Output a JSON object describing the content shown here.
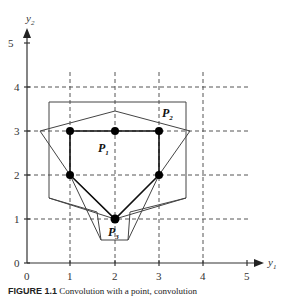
{
  "figure": {
    "caption_label": "FIGURE 1.1",
    "caption_text": "Convolution with a point, convolution",
    "x_axis_label": "y",
    "x_axis_sub": "1",
    "y_axis_label": "y",
    "y_axis_sub": "2",
    "x_ticks": [
      "0",
      "1",
      "2",
      "3",
      "4",
      "5"
    ],
    "y_ticks": [
      "0",
      "1",
      "2",
      "3",
      "4",
      "5"
    ],
    "points": [
      {
        "label": "P",
        "sub": "1",
        "x": 2,
        "y": 3
      },
      {
        "label": "P",
        "sub": "2",
        "x": 3,
        "y": 3
      },
      {
        "label": "P",
        "sub": "3",
        "x": 2,
        "y": 1
      }
    ],
    "colors": {
      "axis": "#333333",
      "grid": "#555555",
      "polygon": "#444444",
      "point": "#000000"
    }
  }
}
